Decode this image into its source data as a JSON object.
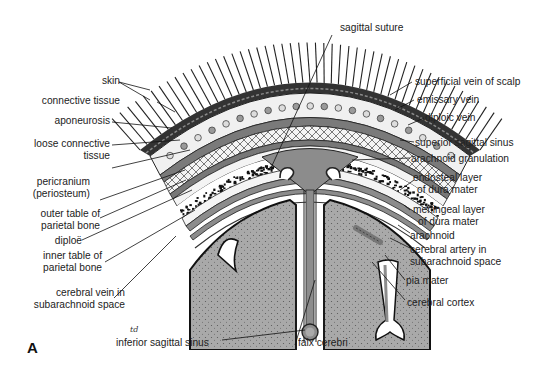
{
  "figure": {
    "panel_label": "A",
    "signature": "td",
    "colors": {
      "brain": "#a9a9a9",
      "dura": "#8c8c8c",
      "outline": "#1a1a1a",
      "bone": "#f2f2f2",
      "diploe": "#151515",
      "hair": "#222222"
    }
  },
  "labels": {
    "left": {
      "skin": "skin",
      "connective_tissue": "connective tissue",
      "aponeurosis": "aponeurosis",
      "loose_connective_tissue_1": "loose connective",
      "loose_connective_tissue_2": "tissue",
      "pericranium_1": "pericranium",
      "pericranium_2": "(periosteum)",
      "outer_table_1": "outer table of",
      "outer_table_2": "parietal bone",
      "diploe": "diploë",
      "inner_table_1": "inner table of",
      "inner_table_2": "parietal bone",
      "cerebral_vein_1": "cerebral vein in",
      "cerebral_vein_2": "subarachnoid space"
    },
    "top": {
      "sagittal_suture": "sagittal suture"
    },
    "right": {
      "superficial_vein": "superficial vein of scalp",
      "emissary_vein": "emissary vein",
      "diploic_vein": "diploic vein",
      "superior_sagittal_sinus": "superior sagittal sinus",
      "arachnoid_granulation": "arachnoid granulation",
      "endosteal_1": "endosteal layer",
      "endosteal_2": "of dura mater",
      "meningeal_1": "meningeal layer",
      "meningeal_2": "of dura mater",
      "arachnoid": "arachnoid",
      "cerebral_artery_1": "cerebral artery in",
      "cerebral_artery_2": "subarachnoid space",
      "pia_mater": "pia mater",
      "cerebral_cortex": "cerebral cortex"
    },
    "bottom": {
      "inferior_sagittal_sinus": "inferior sagittal sinus",
      "falx_cerebri": "falx cerebri"
    }
  }
}
